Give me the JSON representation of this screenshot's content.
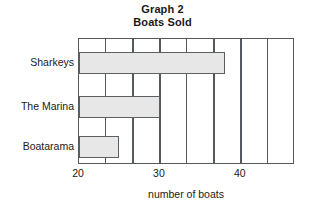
{
  "chart_data": {
    "type": "bar",
    "orientation": "horizontal",
    "title": "Graph 2 Boats Sold",
    "title_lines": [
      "Graph 2",
      "Boats Sold"
    ],
    "categories": [
      "Sharkeys",
      "The Marina",
      "Boatarama"
    ],
    "values": [
      38,
      30,
      25
    ],
    "xlabel": "number of boats",
    "ylabel": "",
    "xlim": [
      20,
      46.7
    ],
    "xticks": [
      20,
      30,
      40
    ],
    "xtick_labels": [
      "20",
      "30",
      "40"
    ],
    "gridlines": [
      20,
      23.3,
      26.7,
      30,
      33.3,
      36.7,
      40,
      43.3,
      46.7
    ],
    "grid": true,
    "legend": null,
    "bar_fill_color": "#e7e7e7",
    "bar_border_color": "#5d6063",
    "axis_color": "#55585c",
    "background_color": "#ffffff"
  }
}
